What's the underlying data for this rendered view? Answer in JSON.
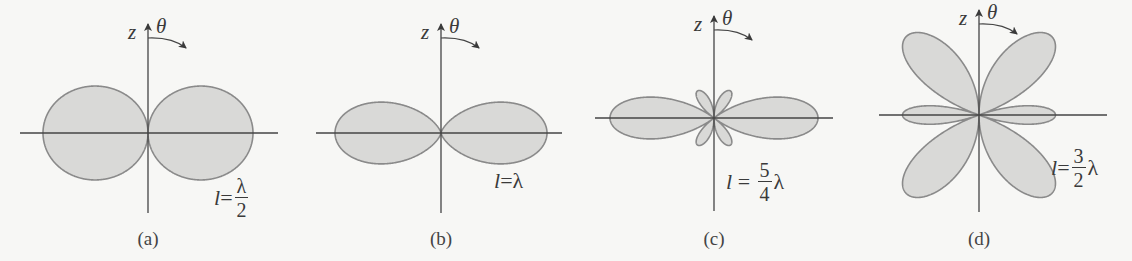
{
  "figure": {
    "type": "dipole-radiation-patterns",
    "fill_color": "#d9d9d7",
    "stroke_color": "#8a8a8a",
    "axis_color": "#444444",
    "background": "#f7f7f5"
  },
  "panels": [
    {
      "id": "a",
      "caption": "(a)",
      "axis_z_label": "z",
      "axis_theta_label": "θ",
      "length_label": {
        "prefix": "l",
        "eq": "=",
        "numerator": "λ",
        "denominator": "2",
        "suffix": ""
      },
      "kl_over_2_pi": 0.5,
      "center": [
        148,
        133
      ],
      "scale": 105,
      "vaxis": [
        22,
        213
      ],
      "haxis": [
        20,
        278
      ],
      "label_pos": [
        214,
        176
      ],
      "caption_pos": [
        148,
        228
      ]
    },
    {
      "id": "b",
      "caption": "(b)",
      "axis_z_label": "z",
      "axis_theta_label": "θ",
      "length_label": {
        "prefix": "l",
        "eq": "=",
        "numerator": "",
        "denominator": "",
        "suffix": "λ"
      },
      "kl_over_2_pi": 1.0,
      "center": [
        441,
        133
      ],
      "scale": 106,
      "vaxis": [
        22,
        213
      ],
      "haxis": [
        316,
        562
      ],
      "label_pos": [
        494,
        168
      ],
      "caption_pos": [
        441,
        228
      ]
    },
    {
      "id": "c",
      "caption": "(c)",
      "axis_z_label": "z",
      "axis_theta_label": "θ",
      "length_label": {
        "prefix": "l",
        "eq": " = ",
        "numerator": "5",
        "denominator": "4",
        "suffix": "λ"
      },
      "kl_over_2_pi": 1.25,
      "center": [
        714,
        118
      ],
      "scale": 104,
      "vaxis": [
        14,
        211
      ],
      "haxis": [
        595,
        833
      ],
      "label_pos": [
        726,
        160
      ],
      "caption_pos": [
        714,
        228
      ]
    },
    {
      "id": "d",
      "caption": "(d)",
      "axis_z_label": "z",
      "axis_theta_label": "θ",
      "length_label": {
        "prefix": "l",
        "eq": "=",
        "numerator": "3",
        "denominator": "2",
        "suffix": "λ"
      },
      "kl_over_2_pi": 1.5,
      "center": [
        979,
        115
      ],
      "scale": 107,
      "vaxis": [
        8,
        212
      ],
      "haxis": [
        879,
        1107
      ],
      "label_pos": [
        1051,
        146
      ],
      "caption_pos": [
        979,
        228
      ]
    }
  ]
}
